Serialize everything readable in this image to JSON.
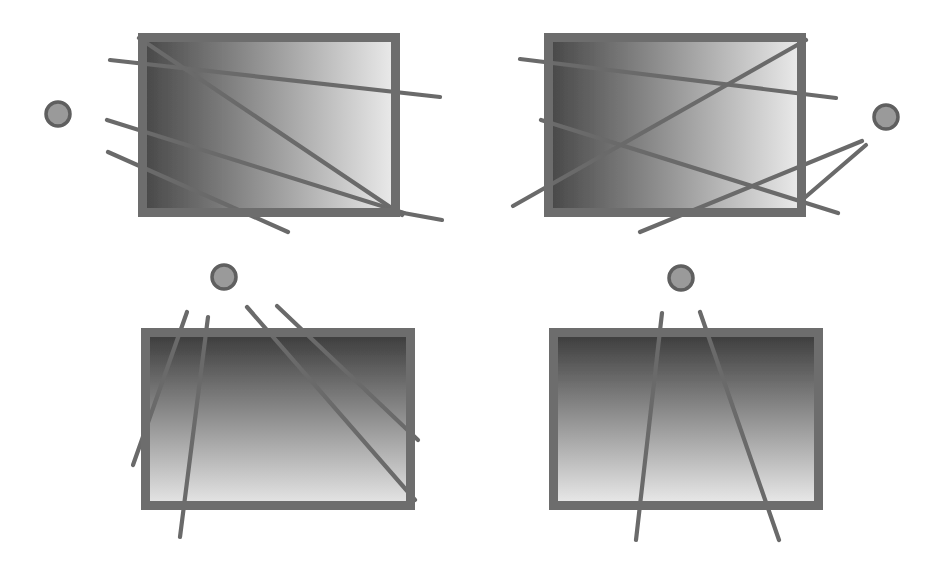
{
  "figure": {
    "background_color": "#ffffff",
    "width": 946,
    "height": 566,
    "panel_count": 4,
    "colors": {
      "frame_stroke": "#6d6d6d",
      "ray_stroke": "#6a6a6a",
      "source_fill": "#9a9a9a",
      "source_stroke": "#5e5e5e",
      "slab_dark": "#4a4a4a",
      "slab_light": "#e6e6e6",
      "background": "#ffffff"
    },
    "panels": [
      {
        "id": "panel-top-left",
        "name": "top-left-panel",
        "source_label": "point-source",
        "source": {
          "cx": 58,
          "cy": 114,
          "r": 12
        },
        "slab": {
          "x": 138,
          "y": 33,
          "w": 262,
          "h": 184,
          "border_width": 9,
          "gradient": "linear",
          "gradient_angle_deg": 90,
          "gradient_from": "#4a4a4a",
          "gradient_to": "#e8e8e8",
          "gradient_note": "dark at left edge, light at right edge"
        },
        "rays": [
          {
            "name": "ray-1",
            "x1": 110,
            "y1": 60,
            "x2": 440,
            "y2": 97
          },
          {
            "name": "ray-2",
            "x1": 107,
            "y1": 120,
            "x2": 404,
            "y2": 213
          },
          {
            "name": "ray-3",
            "x1": 108,
            "y1": 152,
            "x2": 288,
            "y2": 232
          },
          {
            "name": "ray-4",
            "x1": 139,
            "y1": 38,
            "x2": 402,
            "y2": 215
          },
          {
            "name": "ray-5",
            "x1": 398,
            "y1": 212,
            "x2": 442,
            "y2": 220
          }
        ]
      },
      {
        "id": "panel-top-right",
        "name": "top-right-panel",
        "source_label": "point-source",
        "source": {
          "cx": 886,
          "cy": 117,
          "r": 12
        },
        "slab": {
          "x": 544,
          "y": 33,
          "w": 262,
          "h": 184,
          "border_width": 9,
          "gradient": "linear",
          "gradient_angle_deg": 270,
          "gradient_from": "#e8e8e8",
          "gradient_to": "#4a4a4a",
          "gradient_note": "light at left edge, dark at right edge"
        },
        "rays": [
          {
            "name": "ray-1",
            "x1": 520,
            "y1": 59,
            "x2": 836,
            "y2": 98
          },
          {
            "name": "ray-2",
            "x1": 541,
            "y1": 120,
            "x2": 838,
            "y2": 213
          },
          {
            "name": "ray-3",
            "x1": 513,
            "y1": 206,
            "x2": 806,
            "y2": 40
          },
          {
            "name": "ray-4",
            "x1": 640,
            "y1": 232,
            "x2": 862,
            "y2": 141
          },
          {
            "name": "ray-5",
            "x1": 802,
            "y1": 200,
            "x2": 866,
            "y2": 145
          }
        ]
      },
      {
        "id": "panel-bottom-left",
        "name": "bottom-left-panel",
        "source_label": "point-source",
        "source": {
          "cx": 224,
          "cy": 277,
          "r": 12
        },
        "slab": {
          "x": 141,
          "y": 328,
          "w": 274,
          "h": 182,
          "border_width": 9,
          "gradient": "linear",
          "gradient_angle_deg": 180,
          "gradient_from": "#3f3f3f",
          "gradient_to": "#e2e2e2",
          "gradient_note": "dark band at top, lightening downward"
        },
        "rays": [
          {
            "name": "ray-1",
            "x1": 187,
            "y1": 312,
            "x2": 133,
            "y2": 465
          },
          {
            "name": "ray-2",
            "x1": 208,
            "y1": 317,
            "x2": 180,
            "y2": 537
          },
          {
            "name": "ray-3",
            "x1": 247,
            "y1": 307,
            "x2": 415,
            "y2": 500
          },
          {
            "name": "ray-4",
            "x1": 277,
            "y1": 306,
            "x2": 418,
            "y2": 440
          }
        ]
      },
      {
        "id": "panel-bottom-right",
        "name": "bottom-right-panel",
        "source_label": "point-source",
        "source": {
          "cx": 681,
          "cy": 278,
          "r": 12
        },
        "slab": {
          "x": 549,
          "y": 328,
          "w": 274,
          "h": 182,
          "border_width": 9,
          "gradient": "linear",
          "gradient_angle_deg": 180,
          "gradient_from": "#3f3f3f",
          "gradient_to": "#e6e6e6",
          "gradient_note": "dark band at top, lightening downward"
        },
        "rays": [
          {
            "name": "ray-1",
            "x1": 662,
            "y1": 313,
            "x2": 636,
            "y2": 540
          },
          {
            "name": "ray-2",
            "x1": 700,
            "y1": 312,
            "x2": 779,
            "y2": 540
          }
        ]
      }
    ]
  }
}
